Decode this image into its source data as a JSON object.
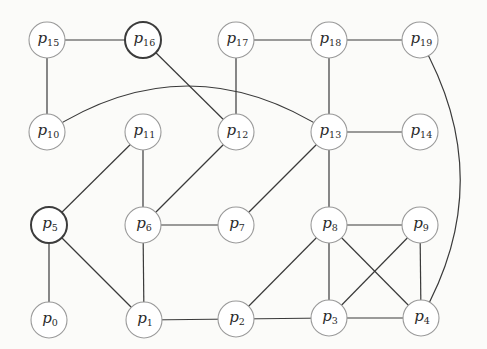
{
  "diagram": {
    "type": "graph",
    "node_radius": 18,
    "colors": {
      "background": "#fbfbf9",
      "edge": "#3a3a3a",
      "node_fill": "#ffffff",
      "node_border": "#9a9a9a",
      "node_border_highlight": "#3c3c3c"
    },
    "nodes": [
      {
        "id": "p0",
        "letter": "p",
        "sub": "0",
        "x": 49,
        "y": 320,
        "highlight": false
      },
      {
        "id": "p1",
        "letter": "p",
        "sub": "1",
        "x": 144,
        "y": 320,
        "highlight": false
      },
      {
        "id": "p2",
        "letter": "p",
        "sub": "2",
        "x": 236,
        "y": 319,
        "highlight": false
      },
      {
        "id": "p3",
        "letter": "p",
        "sub": "3",
        "x": 329,
        "y": 318,
        "highlight": false
      },
      {
        "id": "p4",
        "letter": "p",
        "sub": "4",
        "x": 421,
        "y": 318,
        "highlight": false
      },
      {
        "id": "p5",
        "letter": "p",
        "sub": "5",
        "x": 49,
        "y": 225,
        "highlight": true
      },
      {
        "id": "p6",
        "letter": "p",
        "sub": "6",
        "x": 143,
        "y": 225,
        "highlight": false
      },
      {
        "id": "p7",
        "letter": "p",
        "sub": "7",
        "x": 236,
        "y": 225,
        "highlight": false
      },
      {
        "id": "p8",
        "letter": "p",
        "sub": "8",
        "x": 329,
        "y": 225,
        "highlight": false
      },
      {
        "id": "p9",
        "letter": "p",
        "sub": "9",
        "x": 420,
        "y": 225,
        "highlight": false
      },
      {
        "id": "p10",
        "letter": "p",
        "sub": "10",
        "x": 47,
        "y": 132,
        "highlight": false
      },
      {
        "id": "p11",
        "letter": "p",
        "sub": "11",
        "x": 143,
        "y": 132,
        "highlight": false
      },
      {
        "id": "p12",
        "letter": "p",
        "sub": "12",
        "x": 236,
        "y": 132,
        "highlight": false
      },
      {
        "id": "p13",
        "letter": "p",
        "sub": "13",
        "x": 329,
        "y": 132,
        "highlight": false
      },
      {
        "id": "p14",
        "letter": "p",
        "sub": "14",
        "x": 420,
        "y": 132,
        "highlight": false
      },
      {
        "id": "p15",
        "letter": "p",
        "sub": "15",
        "x": 47,
        "y": 40,
        "highlight": false
      },
      {
        "id": "p16",
        "letter": "p",
        "sub": "16",
        "x": 143,
        "y": 40,
        "highlight": true
      },
      {
        "id": "p17",
        "letter": "p",
        "sub": "17",
        "x": 236,
        "y": 40,
        "highlight": false
      },
      {
        "id": "p18",
        "letter": "p",
        "sub": "18",
        "x": 329,
        "y": 40,
        "highlight": false
      },
      {
        "id": "p19",
        "letter": "p",
        "sub": "19",
        "x": 420,
        "y": 40,
        "highlight": false
      }
    ],
    "edges": [
      {
        "from": "p15",
        "to": "p16"
      },
      {
        "from": "p15",
        "to": "p10"
      },
      {
        "from": "p16",
        "to": "p12"
      },
      {
        "from": "p17",
        "to": "p18"
      },
      {
        "from": "p17",
        "to": "p12"
      },
      {
        "from": "p18",
        "to": "p19"
      },
      {
        "from": "p18",
        "to": "p13"
      },
      {
        "from": "p19",
        "to": "p4",
        "curve": {
          "cx": 500,
          "cy": 180
        }
      },
      {
        "from": "p10",
        "to": "p13",
        "curve": {
          "cx": 188,
          "cy": 40
        }
      },
      {
        "from": "p11",
        "to": "p5"
      },
      {
        "from": "p11",
        "to": "p6"
      },
      {
        "from": "p12",
        "to": "p6"
      },
      {
        "from": "p13",
        "to": "p14"
      },
      {
        "from": "p13",
        "to": "p7"
      },
      {
        "from": "p13",
        "to": "p8"
      },
      {
        "from": "p5",
        "to": "p0"
      },
      {
        "from": "p5",
        "to": "p1"
      },
      {
        "from": "p6",
        "to": "p7"
      },
      {
        "from": "p6",
        "to": "p1"
      },
      {
        "from": "p8",
        "to": "p9"
      },
      {
        "from": "p8",
        "to": "p2"
      },
      {
        "from": "p8",
        "to": "p3"
      },
      {
        "from": "p8",
        "to": "p4"
      },
      {
        "from": "p9",
        "to": "p3"
      },
      {
        "from": "p9",
        "to": "p4"
      },
      {
        "from": "p1",
        "to": "p2"
      },
      {
        "from": "p2",
        "to": "p3"
      },
      {
        "from": "p3",
        "to": "p4"
      }
    ]
  }
}
